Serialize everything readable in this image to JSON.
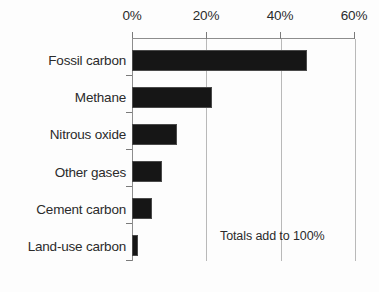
{
  "chart_data": {
    "type": "bar",
    "orientation": "horizontal",
    "title": "",
    "subtitle": "",
    "xlabel": "",
    "ylabel": "",
    "categories": [
      "Fossil carbon",
      "Methane",
      "Nitrous oxide",
      "Other gases",
      "Cement carbon",
      "Land-use carbon"
    ],
    "values": [
      47,
      21.5,
      12,
      8,
      5.5,
      1.5
    ],
    "value_unit": "%",
    "xlim": [
      0,
      60
    ],
    "xticks": [
      0,
      20,
      40,
      60
    ],
    "xtick_labels": [
      "0%",
      "20%",
      "40%",
      "60%"
    ],
    "grid": "vertical",
    "legend": "none",
    "annotations": [
      {
        "text": "Totals add to 100%",
        "x_percent": 24,
        "category_index": 5
      }
    ],
    "colors": {
      "bar_fill": "#161616",
      "bar_stroke": "#4a4a4a",
      "gridline": "#b9b9b9",
      "axis": "#8d8d8d",
      "text": "#2b2b2b",
      "background": "#fdfdfd"
    }
  }
}
